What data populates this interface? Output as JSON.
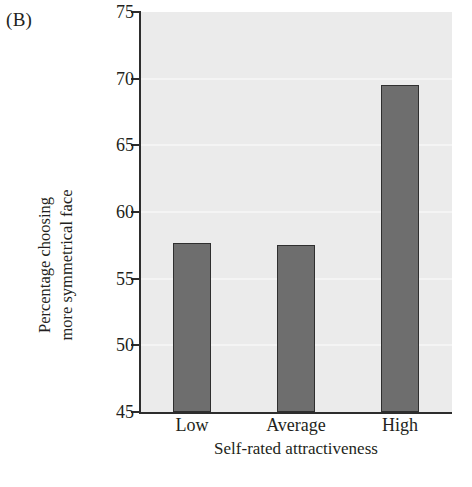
{
  "panel": {
    "label": "(B)"
  },
  "chart_data": {
    "type": "bar",
    "title": "",
    "subtitle": "",
    "categories": [
      "Low",
      "Average",
      "High"
    ],
    "values": [
      57.7,
      57.5,
      69.5
    ],
    "series": [
      {
        "name": "Percentage choosing more symmetrical face",
        "values": [
          57.7,
          57.5,
          69.5
        ]
      }
    ],
    "xlabel": "Self-rated attractiveness",
    "ylabel_line1": "Percentage choosing",
    "ylabel_line2": "more symmetrical face",
    "ylim": [
      45,
      75
    ],
    "yticks": [
      45,
      50,
      55,
      60,
      65,
      70,
      75
    ],
    "ytick_labels": [
      "45",
      "50",
      "55",
      "60",
      "65",
      "70",
      "75"
    ],
    "grid": true,
    "grid_axis": "y",
    "legend": false,
    "legend_position": "none",
    "bar_color": "#6e6e6e",
    "bar_edge_color": "#2f2f2f",
    "plot_background": "#ebebeb",
    "gridline_color": "#f4f4f4",
    "axis_color": "#2d2d2d"
  }
}
